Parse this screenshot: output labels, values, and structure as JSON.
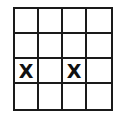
{
  "grid": {
    "rows": 4,
    "cols": 4,
    "cells": [
      [
        "",
        "",
        "",
        ""
      ],
      [
        "",
        "",
        "",
        ""
      ],
      [
        "X",
        "",
        "X",
        ""
      ],
      [
        "",
        "",
        "",
        ""
      ]
    ]
  }
}
